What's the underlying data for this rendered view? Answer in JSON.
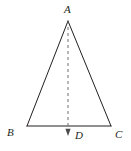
{
  "figure": {
    "kind": "geometry-diagram",
    "canvas": {
      "width": 131,
      "height": 151,
      "background": "#ffffff"
    },
    "style": {
      "stroke_color": "#231f20",
      "stroke_width": 1,
      "dash_color": "#6d6e71",
      "dash_pattern": "3 3",
      "label_color": "#231f20"
    },
    "points": {
      "A": {
        "label": "A",
        "x": 68,
        "y": 21
      },
      "B": {
        "label": "B",
        "x": 27,
        "y": 126
      },
      "C": {
        "label": "C",
        "x": 111,
        "y": 126
      },
      "D": {
        "label": "D",
        "x": 68,
        "y": 126
      }
    },
    "segments": [
      {
        "name": "AB",
        "from": "A",
        "to": "B",
        "style": "solid"
      },
      {
        "name": "AC",
        "from": "A",
        "to": "C",
        "style": "solid"
      },
      {
        "name": "BC",
        "from": "B",
        "to": "C",
        "style": "solid"
      },
      {
        "name": "AD",
        "from": "A",
        "to": "D",
        "style": "dashed",
        "arrow": "down"
      }
    ],
    "arrow": {
      "tip_x": 68,
      "tip_y": 136,
      "half_width": 2.6,
      "base_y": 129
    },
    "labels": {
      "A": "A",
      "B": "B",
      "C": "C",
      "D": "D"
    }
  }
}
